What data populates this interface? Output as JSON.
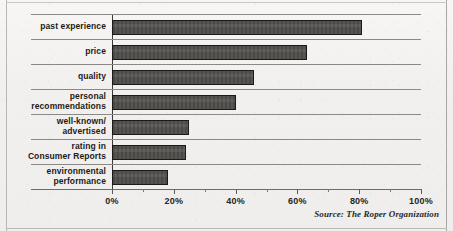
{
  "chart_data": {
    "type": "bar",
    "orientation": "horizontal",
    "title": "",
    "subtitle": "",
    "xlabel": "",
    "ylabel": "",
    "xlim": [
      0,
      100
    ],
    "grid": false,
    "row_separators": true,
    "legend": null,
    "legend_position": "none",
    "categories": [
      "past experience",
      "price",
      "quality",
      "personal\nrecommendations",
      "well-known/\nadvertised",
      "rating in\nConsumer Reports",
      "environmental\nperformance"
    ],
    "category_lines": [
      [
        "past experience"
      ],
      [
        "price"
      ],
      [
        "quality"
      ],
      [
        "personal",
        "recommendations"
      ],
      [
        "well-known/",
        "advertised"
      ],
      [
        "rating in",
        "Consumer Reports"
      ],
      [
        "environmental",
        "performance"
      ]
    ],
    "values": [
      81,
      63,
      46,
      40,
      25,
      24,
      18
    ],
    "value_unit": "%",
    "tick_labels": [
      "0%",
      "20%",
      "40%",
      "60%",
      "80%",
      "100%"
    ],
    "tick_values": [
      0,
      20,
      40,
      60,
      80,
      100
    ],
    "minor_tick_values": [
      10,
      30,
      50,
      70,
      90
    ],
    "annotations": [
      {
        "name": "source-note",
        "text": "Source: The Roper Organization"
      }
    ],
    "colors": {
      "bar_fill": "#4d4c49",
      "bar_border": "#1b1a18",
      "axis": "#3b3a38",
      "row_separator": "#8b8986",
      "text": "#1d1c18",
      "background": "#f1f0ee"
    }
  }
}
